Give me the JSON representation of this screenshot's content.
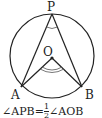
{
  "diagram": {
    "circle": {
      "cx": 52,
      "cy": 56,
      "r": 42
    },
    "points": {
      "P": {
        "x": 52,
        "y": 14,
        "label": "P"
      },
      "O": {
        "x": 52,
        "y": 58,
        "label": "O"
      },
      "A": {
        "x": 21,
        "y": 87,
        "label": "A"
      },
      "B": {
        "x": 82,
        "y": 87,
        "label": "B"
      }
    },
    "stroke_color": "#222222"
  },
  "caption": {
    "left": "∠APB=",
    "frac_num": "1",
    "frac_den": "2",
    "right": "∠AOB"
  }
}
